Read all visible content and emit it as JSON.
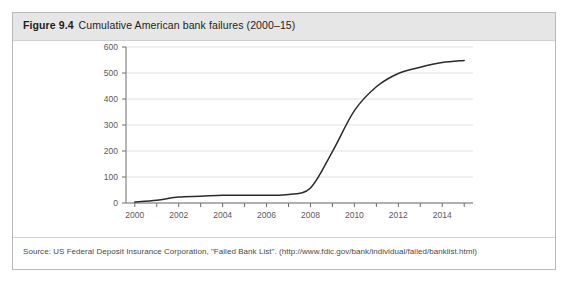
{
  "figure": {
    "number": "Figure 9.4",
    "title": "Cumulative American bank failures (2000–15)",
    "source": "Source: US Federal Deposit Insurance Corporation, \"Failed Bank List\". (http://www.fdic.gov/bank/individual/failed/banklist.html)"
  },
  "colors": {
    "header_band": "#e6e6e6",
    "frame_border": "#b9b9b9",
    "gridline": "#e2e2e2",
    "axis": "#6e6e70",
    "line": "#2b2b2b",
    "tick_text": "#59595c"
  },
  "chart_data": {
    "type": "line",
    "title": "Cumulative American bank failures (2000–15)",
    "xlabel": "",
    "ylabel": "",
    "xlim": [
      1999.6,
      2015.4
    ],
    "ylim": [
      0,
      600
    ],
    "grid": true,
    "legend": "none",
    "ytick_labels": [
      "0",
      "100",
      "200",
      "300",
      "400",
      "500",
      "600"
    ],
    "ytick_values": [
      0,
      100,
      200,
      300,
      400,
      500,
      600
    ],
    "xtick_labels": [
      "2000",
      "2002",
      "2004",
      "2006",
      "2008",
      "2010",
      "2012",
      "2014"
    ],
    "xtick_values": [
      2000,
      2002,
      2004,
      2006,
      2008,
      2010,
      2012,
      2014
    ],
    "xtick_minor_values": [
      2001,
      2003,
      2005,
      2007,
      2009,
      2011,
      2013,
      2015
    ],
    "x": [
      2000,
      2001,
      2002,
      2003,
      2004,
      2005,
      2006,
      2007,
      2008,
      2009,
      2010,
      2011,
      2012,
      2013,
      2014,
      2015
    ],
    "series": [
      {
        "name": "Cumulative bank failures",
        "values": [
          4,
          11,
          23,
          26,
          30,
          30,
          30,
          33,
          58,
          198,
          355,
          447,
          498,
          522,
          540,
          548
        ]
      }
    ]
  }
}
